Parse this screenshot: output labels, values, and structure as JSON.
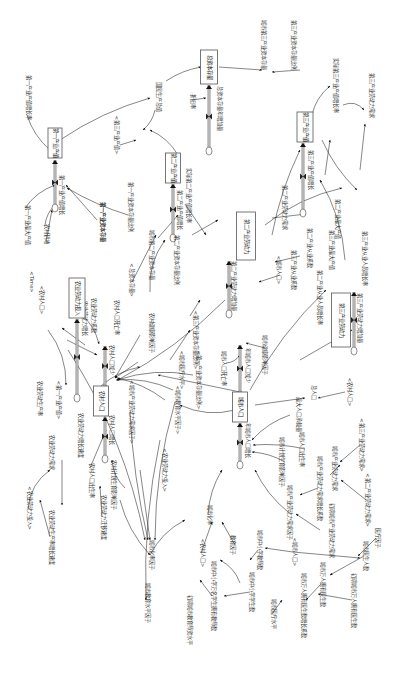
{
  "diagram": {
    "title": "",
    "orientation": "rotated-90-clockwise",
    "stocks": [
      {
        "id": "s_gdp1",
        "label": "第一产业产值"
      },
      {
        "id": "s_capital",
        "label": "总资本存量"
      },
      {
        "id": "s_gdp2",
        "label": "第二产业产值"
      },
      {
        "id": "s_gdp3",
        "label": "第三产业产值"
      },
      {
        "id": "s_agrilabor",
        "label": "农业劳动力投入"
      },
      {
        "id": "s_labor2",
        "label": "第二产业劳动力"
      },
      {
        "id": "s_labor3",
        "label": "第三产业劳动力"
      },
      {
        "id": "s_rural",
        "label": "农村人口"
      },
      {
        "id": "s_urban",
        "label": "城市人口"
      }
    ],
    "flows": [
      {
        "id": "f_gdp1",
        "label": "第一产业产值增长"
      },
      {
        "id": "f_capital",
        "label": "总资本存量年增加量"
      },
      {
        "id": "f_gdp2",
        "label": "第二产业产值增长"
      },
      {
        "id": "f_gdp3",
        "label": "第三产业产值增长"
      },
      {
        "id": "f_agrilabor",
        "label": "农业劳动力增长"
      },
      {
        "id": "f_labor2",
        "label": "第二产业劳动力增加量"
      },
      {
        "id": "f_labor3",
        "label": "第三产业劳动力增加量"
      },
      {
        "id": "f_rural_in",
        "label": "农村人口增长"
      },
      {
        "id": "f_rural_out",
        "label": "农村人口减少"
      },
      {
        "id": "f_urban_in",
        "label": "年城市人口增长"
      },
      {
        "id": "f_urban_out",
        "label": "年城市人口减少"
      }
    ],
    "variables": [
      {
        "id": "v1",
        "label": "第一产业产值增长率"
      },
      {
        "id": "v2",
        "label": "国民生产总值"
      },
      {
        "id": "v3",
        "label": "<第三产业产值>"
      },
      {
        "id": "v4",
        "label": "城市第三产业资本存量"
      },
      {
        "id": "v5",
        "label": "第三产业资本存量比例"
      },
      {
        "id": "v6",
        "label": "实际第三产业产值增长率"
      },
      {
        "id": "v7",
        "label": "第三产业劳动力需求"
      },
      {
        "id": "v8",
        "label": "第一产业最大产值"
      },
      {
        "id": "v9",
        "label": "农村耕地"
      },
      {
        "id": "v10",
        "label": "第一产业资本存量"
      },
      {
        "id": "v11",
        "label": "第一产业资本存量比例"
      },
      {
        "id": "v12",
        "label": "<Time>"
      },
      {
        "id": "v13",
        "label": "<农村人口>"
      },
      {
        "id": "v14",
        "label": "<总资本存量>"
      },
      {
        "id": "v15",
        "label": "城市第二产业资本存量"
      },
      {
        "id": "v16",
        "label": "第二产业资本存量比例"
      },
      {
        "id": "v17",
        "label": "实际第二产业产值增长率"
      },
      {
        "id": "v18",
        "label": "第二产业劳动力需求"
      },
      {
        "id": "v19",
        "label": "第二产业从业系数"
      },
      {
        "id": "v20",
        "label": "<城市人口>"
      },
      {
        "id": "v21",
        "label": "第二产业从业人员增长率"
      },
      {
        "id": "v22",
        "label": "第三产业最大产值"
      },
      {
        "id": "v23",
        "label": "第三产业从业人员增长率"
      },
      {
        "id": "v24",
        "label": "第三产业从业系数"
      },
      {
        "id": "v25",
        "label": "农业劳动力系数"
      },
      {
        "id": "v26",
        "label": "农村人口死亡率"
      },
      {
        "id": "v27",
        "label": "农村健康影响因子"
      },
      {
        "id": "v28",
        "label": "<第三产业资本存量比例>"
      },
      {
        "id": "v29",
        "label": "<第一产业资本存量比例>"
      },
      {
        "id": "v30",
        "label": "农业劳动生产率"
      },
      {
        "id": "v31",
        "label": "<第一产业产值>"
      },
      {
        "id": "v32",
        "label": "农业劳动力需求"
      },
      {
        "id": "v33",
        "label": "农业劳动力增长速度"
      },
      {
        "id": "v34",
        "label": "<城市产业劳动力需求因子>"
      },
      {
        "id": "v35",
        "label": "<城市教育水平因子>"
      },
      {
        "id": "v36",
        "label": "<城市医疗水平>"
      },
      {
        "id": "v37",
        "label": "农村计划生育影响因子"
      },
      {
        "id": "v38",
        "label": "农村人口出生率"
      },
      {
        "id": "v39",
        "label": "<农业劳动力投入>"
      },
      {
        "id": "v40",
        "label": "城市人口死亡率"
      },
      {
        "id": "v41",
        "label": "城市健康影响因子"
      },
      {
        "id": "v42",
        "label": "总人口"
      },
      {
        "id": "v43",
        "label": "<农村人口>"
      },
      {
        "id": "v44",
        "label": "最大人口承载量"
      },
      {
        "id": "v45",
        "label": "城市人口出生率"
      },
      {
        "id": "v46",
        "label": "城市计划生育影响因子"
      },
      {
        "id": "v47",
        "label": "城市产业劳动力需求"
      },
      {
        "id": "v48",
        "label": "<第三产业劳动力需求>"
      },
      {
        "id": "v49",
        "label": "<第二产业劳动力需求>"
      },
      {
        "id": "v50",
        "label": "城市产业劳动力需求因子"
      },
      {
        "id": "v51",
        "label": "城市产业劳动力需求增长系数"
      },
      {
        "id": "v52",
        "label": "初期城市产业劳动力需求"
      },
      {
        "id": "v53",
        "label": "医疗因子"
      },
      {
        "id": "v54",
        "label": "城市化率"
      },
      {
        "id": "v55",
        "label": "<农村人口>"
      },
      {
        "id": "v56",
        "label": "教育因子"
      },
      {
        "id": "v57",
        "label": "城市中小学教师数"
      },
      {
        "id": "v58",
        "label": "<城市人口>"
      },
      {
        "id": "v59",
        "label": "城市医生人数"
      },
      {
        "id": "v60",
        "label": "城市化率因子"
      },
      {
        "id": "v61",
        "label": "农业劳动力迁移速度"
      },
      {
        "id": "v62",
        "label": "农业劳动生产率增长速度"
      },
      {
        "id": "v63",
        "label": "<农业劳动力投入>"
      },
      {
        "id": "v64",
        "label": "城市教育水平因子"
      },
      {
        "id": "v65",
        "label": "城市中小学万名学生拥有教师数"
      },
      {
        "id": "v66",
        "label": "城市中小学学生数"
      },
      {
        "id": "v67",
        "label": "初期城市教育师资水平"
      },
      {
        "id": "v68",
        "label": "城市医疗水平"
      },
      {
        "id": "v69",
        "label": "城市万人拥有医生数"
      },
      {
        "id": "v70",
        "label": "城市万人拥有医生数增长系数"
      },
      {
        "id": "v71",
        "label": "初期城市万人拥有医生数"
      },
      {
        "id": "v72",
        "label": "第二产业最大产值"
      },
      {
        "id": "v73",
        "label": "折旧率"
      },
      {
        "id": "v74",
        "label": "第一产业资本存量"
      }
    ]
  }
}
